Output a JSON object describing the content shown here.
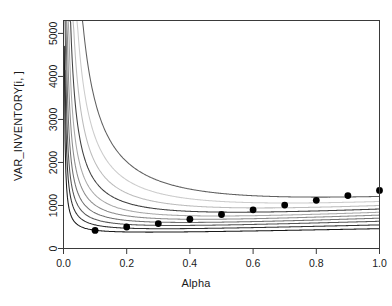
{
  "chart_data": {
    "type": "line",
    "title": "",
    "xlabel": "Alpha",
    "ylabel": "VAR_INVENTORY[i, ]",
    "xlim": [
      0.0,
      1.0
    ],
    "ylim": [
      0,
      5300
    ],
    "grid": false,
    "legend": "none",
    "xticks": [
      "0.0",
      "0.2",
      "0.4",
      "0.6",
      "0.8",
      "1.0"
    ],
    "xtick_values": [
      0.0,
      0.2,
      0.4,
      0.6,
      0.8,
      1.0
    ],
    "yticks": [
      "0",
      "1000",
      "2000",
      "3000",
      "4000",
      "5000"
    ],
    "ytick_values": [
      0,
      1000,
      2000,
      3000,
      4000,
      5000
    ],
    "box": true,
    "x": [
      0.01,
      0.05,
      0.1,
      0.15,
      0.2,
      0.25,
      0.3,
      0.35,
      0.4,
      0.45,
      0.5,
      0.55,
      0.6,
      0.65,
      0.7,
      0.75,
      0.8,
      0.85,
      0.9,
      0.95,
      1.0
    ],
    "series": [
      {
        "name": "curve-1",
        "color": "#1a1a1a",
        "k": 11,
        "base": 300,
        "slope": 150,
        "values": [
          5300,
          520,
          370,
          345,
          340,
          345,
          355,
          370,
          390,
          415,
          440,
          470,
          500,
          535,
          570,
          610,
          650,
          695,
          740,
          790,
          840
        ]
      },
      {
        "name": "curve-2",
        "color": "#303030",
        "k": 19,
        "base": 340,
        "slope": 190,
        "values": [
          5300,
          700,
          440,
          395,
          385,
          385,
          395,
          410,
          430,
          455,
          485,
          520,
          555,
          595,
          635,
          680,
          725,
          775,
          825,
          880,
          935
        ]
      },
      {
        "name": "curve-3",
        "color": "#555555",
        "k": 28,
        "base": 375,
        "slope": 230,
        "values": [
          5300,
          920,
          530,
          455,
          430,
          425,
          432,
          448,
          470,
          498,
          530,
          568,
          608,
          652,
          698,
          748,
          800,
          855,
          912,
          972,
          1035
        ]
      },
      {
        "name": "curve-4",
        "color": "#707070",
        "k": 40,
        "base": 400,
        "slope": 265,
        "values": [
          5300,
          1200,
          650,
          530,
          490,
          478,
          480,
          492,
          512,
          540,
          575,
          615,
          660,
          708,
          760,
          815,
          873,
          935,
          1000,
          1068,
          1140
        ]
      },
      {
        "name": "curve-5",
        "color": "#8c8c8c",
        "k": 56,
        "base": 420,
        "slope": 300,
        "values": [
          5300,
          1560,
          810,
          630,
          565,
          540,
          535,
          543,
          560,
          588,
          622,
          664,
          712,
          765,
          822,
          883,
          948,
          1017,
          1090,
          1166,
          1245
        ]
      },
      {
        "name": "curve-6",
        "color": "#a8a8a8",
        "k": 78,
        "base": 435,
        "slope": 330,
        "values": [
          5300,
          2010,
          1015,
          765,
          665,
          622,
          606,
          606,
          618,
          640,
          670,
          710,
          756,
          808,
          866,
          929,
          997,
          1070,
          1147,
          1228,
          1314
        ]
      },
      {
        "name": "curve-7",
        "color": "#404040",
        "k": 108,
        "base": 450,
        "slope": 360,
        "values": [
          5300,
          2610,
          1290,
          950,
          800,
          730,
          698,
          688,
          693,
          710,
          736,
          772,
          815,
          866,
          922,
          984,
          1052,
          1125,
          1203,
          1286,
          1374
        ]
      },
      {
        "name": "curve-8",
        "color": "#bcbcbc",
        "k": 150,
        "base": 460,
        "slope": 390,
        "values": [
          5300,
          3420,
          1660,
          1180,
          965,
          860,
          808,
          786,
          782,
          792,
          813,
          843,
          882,
          928,
          982,
          1042,
          1108,
          1180,
          1258,
          1341,
          1430
        ]
      },
      {
        "name": "curve-9",
        "color": "#cccccc",
        "k": 208,
        "base": 470,
        "slope": 415,
        "values": [
          5300,
          4430,
          2150,
          1510,
          1210,
          1052,
          968,
          924,
          906,
          906,
          918,
          941,
          973,
          1013,
          1061,
          1116,
          1178,
          1246,
          1320,
          1400,
          1485
        ]
      },
      {
        "name": "curve-10",
        "color": "#606060",
        "k": 290,
        "base": 480,
        "slope": 440,
        "values": [
          5300,
          5300,
          2820,
          1930,
          1520,
          1292,
          1163,
          1090,
          1052,
          1038,
          1040,
          1055,
          1080,
          1113,
          1155,
          1204,
          1260,
          1323,
          1392,
          1467,
          1548
        ]
      }
    ],
    "points": {
      "name": "minimum-envelope-points",
      "marker": "filled-circle",
      "color": "#000000",
      "x": [
        0.1,
        0.2,
        0.3,
        0.4,
        0.5,
        0.6,
        0.7,
        0.8,
        0.9,
        1.0
      ],
      "y": [
        420,
        500,
        580,
        680,
        790,
        900,
        1010,
        1120,
        1230,
        1350
      ]
    }
  }
}
